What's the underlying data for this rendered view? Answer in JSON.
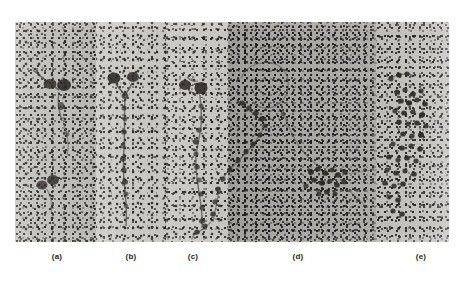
{
  "figure": {
    "type": "electron-micrograph-panel-series",
    "background_color": "#ffffff",
    "strip": {
      "x": 15,
      "y": 22,
      "width": 434,
      "height": 220,
      "base_tone": "#c6c5c1"
    },
    "panels": [
      {
        "id": "a",
        "label": "(a)",
        "label_x": 57,
        "x": 0,
        "width": 81,
        "tone": "#c6c5c1",
        "description": "grainy field with two dark beaded clusters joined by a faint thin filament"
      },
      {
        "id": "b",
        "label": "(b)",
        "label_x": 131,
        "x": 81,
        "width": 70,
        "tone": "#cbcac6",
        "description": "Y-shaped branched fiber with two dark globular heads at the fork and a long beaded stalk running down"
      },
      {
        "id": "c",
        "label": "(c)",
        "label_x": 193,
        "x": 151,
        "width": 62,
        "tone": "#c9c8c4",
        "description": "two dark globules at top with a long wavy beaded filament descending and curving"
      },
      {
        "id": "d",
        "label": "(d)",
        "label_x": 298,
        "x": 213,
        "width": 148,
        "tone": "#a9a8a4",
        "description": "darker denser field; large open loop of beaded fiber branching into a central cluster of dark particles"
      },
      {
        "id": "e",
        "label": "(e)",
        "label_x": 421,
        "x": 361,
        "width": 73,
        "tone": "#c2c1bd",
        "description": "dense rosette of dark particles forming a crescent-shaped aggregate"
      }
    ],
    "particle_color": "#2b2926",
    "filament_color": "#4d4a46"
  },
  "caption": {
    "labels": [
      "(a)",
      "(b)",
      "(c)",
      "(d)",
      "(e)"
    ]
  }
}
